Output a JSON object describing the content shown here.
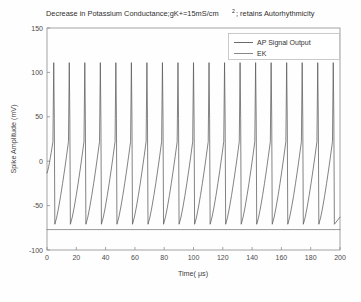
{
  "figure": {
    "background_color": "#fefefe",
    "title_main": "Decrease in Potassium Conductance;gK+=15mS/cm",
    "title_superscript": "2",
    "title_tail": "; retains Autorhythmicity"
  },
  "chart_data": {
    "type": "line",
    "xlabel": "Time( μs)",
    "ylabel": "Spike Amplitude (mV)",
    "xlim": [
      0,
      200
    ],
    "ylim": [
      -100,
      150
    ],
    "xticks": [
      0,
      20,
      40,
      60,
      80,
      100,
      120,
      140,
      160,
      180,
      200
    ],
    "yticks": [
      -100,
      -50,
      0,
      50,
      100,
      150
    ],
    "xtick_labels": [
      "0",
      "20",
      "40",
      "60",
      "80",
      "100",
      "120",
      "140",
      "160",
      "180",
      "200"
    ],
    "ytick_labels": [
      "-100",
      "-50",
      "0",
      "50",
      "100",
      "150"
    ],
    "grid": false,
    "legend_position": "upper right",
    "series": [
      {
        "name": "AP Signal Output",
        "color": "#5a5a5a",
        "waveform": "action-potential-train",
        "spike_count": 19,
        "period_us": 10.6,
        "first_peak_us": 4.6,
        "peak_mv": 111,
        "trough_mv": -71,
        "threshold_mv": 22,
        "rise_us": 0.55,
        "fall_us": 0.75,
        "notch_mv": 48,
        "notch_frac": 0.52
      },
      {
        "name": "EK",
        "color": "#7a7a7a",
        "waveform": "constant",
        "value_mv": -77
      }
    ]
  },
  "legend": {
    "entries": [
      {
        "label": "AP Signal Output"
      },
      {
        "label": "EK"
      }
    ]
  }
}
